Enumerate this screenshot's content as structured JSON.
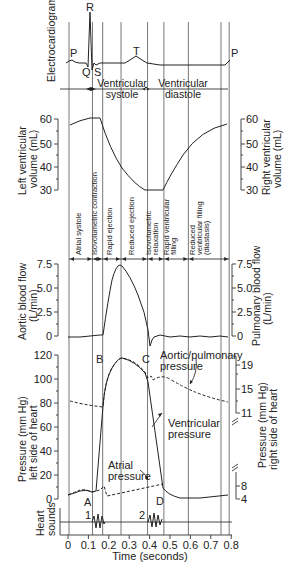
{
  "chart_data": {
    "type": "line",
    "xlabel": "Time (seconds)",
    "x_ticks": [
      0,
      0.1,
      0.2,
      0.3,
      0.4,
      0.5,
      0.6,
      0.7,
      0.8
    ],
    "xlim": [
      0,
      0.8
    ],
    "grid": false,
    "phase_boundaries_s": [
      0.0,
      0.12,
      0.17,
      0.26,
      0.39,
      0.47,
      0.59,
      0.75,
      0.79
    ],
    "phases": [
      "Atrial systole",
      "Isovolumetric contraction",
      "Rapid ejection",
      "Reduced ejection",
      "Isovolumetric relaxation",
      "Rapid ventricular filling",
      "Reduced ventricular filling (diastasis)"
    ],
    "panels": [
      {
        "id": "ecg",
        "ylabel": "Electrocardiogram",
        "wave_labels": [
          "P",
          "R",
          "Q",
          "S",
          "T",
          "P"
        ],
        "intervals": [
          "Ventricular systole",
          "Ventricular diastole"
        ]
      },
      {
        "id": "volume",
        "ylabel_left": "Left ventricular volume (mL)",
        "ylabel_right": "Right ventricular volume (mL)",
        "ylim": [
          30,
          60
        ],
        "y_ticks": [
          30,
          40,
          50,
          60
        ],
        "series": [
          {
            "name": "Ventricular volume",
            "x": [
              0.0,
              0.05,
              0.1,
              0.17,
              0.2,
              0.26,
              0.32,
              0.39,
              0.47,
              0.52,
              0.59,
              0.66,
              0.75,
              0.79
            ],
            "y": [
              58,
              59.5,
              60.5,
              60.5,
              52,
              41,
              35,
              30.5,
              30.5,
              37,
              46,
              53,
              57,
              58
            ]
          }
        ]
      },
      {
        "id": "flow",
        "ylabel_left": "Aortic blood flow (L/min)",
        "ylabel_right": "Pulmonary blood flow (L/min)",
        "ylim": [
          0,
          7.5
        ],
        "y_ticks": [
          0,
          2.5,
          5.0,
          7.5
        ],
        "series": [
          {
            "name": "Aortic/pulmonary flow",
            "x": [
              0.0,
              0.12,
              0.17,
              0.2,
              0.23,
              0.26,
              0.3,
              0.35,
              0.39,
              0.41,
              0.43,
              0.45,
              0.5,
              0.6,
              0.7,
              0.79
            ],
            "y": [
              0,
              0,
              0.1,
              4.0,
              7.0,
              7.3,
              6.0,
              4.0,
              1.5,
              -0.2,
              -1.0,
              0.2,
              0.1,
              0,
              0.1,
              0
            ]
          }
        ]
      },
      {
        "id": "pressure",
        "ylabel_left": "Pressure (mm Hg) left side of heart",
        "ylabel_right": "Pressure (mm Hg) right side of heart",
        "ylim": [
          0,
          120
        ],
        "y_ticks_left": [
          0,
          20,
          40,
          60,
          80,
          100,
          120
        ],
        "y_ticks_right": [
          4,
          8,
          11,
          15,
          19
        ],
        "series": [
          {
            "name": "Aortic/pulmonary pressure",
            "style": "dashed",
            "x": [
              0.0,
              0.1,
              0.17,
              0.2,
              0.26,
              0.33,
              0.38,
              0.39,
              0.41,
              0.45,
              0.55,
              0.65,
              0.79
            ],
            "y": [
              82,
              79,
              77,
              105,
              117,
              114,
              105,
              103,
              99,
              102,
              93,
              86,
              82
            ]
          },
          {
            "name": "Ventricular pressure",
            "x": [
              0.0,
              0.06,
              0.12,
              0.17,
              0.2,
              0.26,
              0.33,
              0.39,
              0.42,
              0.47,
              0.55,
              0.65,
              0.79
            ],
            "y": [
              3,
              7,
              5,
              78,
              105,
              117,
              112,
              100,
              50,
              10,
              2,
              1,
              4
            ]
          },
          {
            "name": "Atrial pressure",
            "style": "dashed",
            "x": [
              0.0,
              0.06,
              0.12,
              0.15,
              0.17,
              0.26,
              0.39,
              0.47,
              0.55,
              0.65,
              0.79
            ],
            "y": [
              3,
              7,
              5,
              9,
              2,
              5,
              8,
              11,
              2,
              1,
              4
            ]
          }
        ],
        "annotations": [
          "A",
          "B",
          "C",
          "D",
          "Aortic/pulmonary pressure",
          "Ventricular pressure",
          "Atrial pressure"
        ]
      },
      {
        "id": "heart_sounds",
        "ylabel": "Heart sounds",
        "sounds": [
          {
            "label": "1",
            "t_start": 0.12,
            "t_end": 0.17
          },
          {
            "label": "2",
            "t_start": 0.39,
            "t_end": 0.45
          }
        ]
      }
    ]
  },
  "labels": {
    "ecg": "Electrocardiogram",
    "p1": "P",
    "r": "R",
    "q": "Q",
    "s": "S",
    "t": "T",
    "p2": "P",
    "vent_systole_1": "Ventricular",
    "vent_systole_2": "systole",
    "vent_diastole_1": "Ventricular",
    "vent_diastole_2": "diastole",
    "lv_vol_1": "Left ventricular",
    "lv_vol_2": "volume (mL)",
    "rv_vol_1": "Right ventricular",
    "rv_vol_2": "volume (mL)",
    "vol_ticks": [
      "60",
      "50",
      "40",
      "30"
    ],
    "phase_1": "Atrial systole",
    "phase_2": "Isovolumetric contraction",
    "phase_3": "Rapid ejection",
    "phase_4": "Reduced ejection",
    "phase_5a": "Isovolumetric",
    "phase_5b": "relaxation",
    "phase_6a": "Rapid ventricular",
    "phase_6b": "filling",
    "phase_7a": "Reduced",
    "phase_7b": "ventricular filling",
    "phase_7c": "(diastasis)",
    "aflow_1": "Aortic blood flow",
    "aflow_2": "(L/min)",
    "pflow_1": "Pulmonary blood flow",
    "pflow_2": "(L/min)",
    "flow_ticks": [
      "7.5",
      "5.0",
      "2.5",
      "0"
    ],
    "pl_1": "Pressure (mm Hg)",
    "pl_2": "left side of heart",
    "pr_1": "Pressure (mm Hg)",
    "pr_2": "right side of heart",
    "p_ticks": [
      "120",
      "100",
      "80",
      "60",
      "40",
      "20",
      "0"
    ],
    "pr_ticks": [
      "19",
      "15",
      "11",
      "8",
      "4"
    ],
    "ann_a": "A",
    "ann_b": "B",
    "ann_c": "C",
    "ann_d": "D",
    "aortic_1": "Aortic/pulmonary",
    "aortic_2": "pressure",
    "ventp_1": "Ventricular",
    "ventp_2": "pressure",
    "atrial_1": "Atrial",
    "atrial_2": "pressure",
    "hs_1": "Heart",
    "hs_2": "sounds",
    "s1": "1",
    "s2": "2",
    "x_ticks": [
      "0",
      "0.1",
      "0.2",
      "0.3",
      "0.4",
      "0.5",
      "0.6",
      "0.7",
      "0.8"
    ],
    "xlabel": "Time (seconds)"
  }
}
